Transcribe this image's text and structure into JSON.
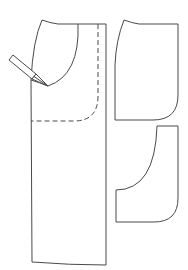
{
  "diagram": {
    "type": "sewing-pattern",
    "background": "#ffffff",
    "stroke_color": "#4a4a4a",
    "pieces": [
      {
        "name": "main-panel",
        "description": "Front panel with curved pocket opening and dashed stitching line"
      },
      {
        "name": "pocket-lining-upper",
        "description": "Upper pocket lining piece"
      },
      {
        "name": "pocket-facing-lower",
        "description": "Lower pocket facing piece with curved top"
      }
    ],
    "tool": "pencil",
    "annotations": []
  }
}
